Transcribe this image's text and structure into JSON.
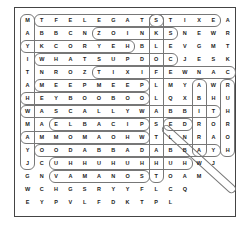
{
  "puzzle": {
    "type": "word-search",
    "columns": 15,
    "rows": [
      "MTFELEGATSTIXEA",
      "ABBCNZOINKSNEWR",
      "YKCORYEHBLEVGMT",
      "IWHATSUPDOCJESK",
      "TNROZTIXIFEWNAC",
      "AMEEPMEEPLMYAWR",
      "HEYBOOBOOLQXBHU",
      "WASCALLYWABBITH",
      "MAELBACIPSEDROR",
      "AMMOMAOHWTLNRAO",
      "YOODABBADABBAYH",
      "JCUHHUHUHHUHWJ",
      "GNVAMANOSTOAM",
      "WCHGSRYYFLCQ",
      "EYPVLFDKTPL"
    ],
    "found_words": [
      {
        "word": "MAYITAHWMAYJ",
        "dir": "vertical",
        "row": 0,
        "col": 0,
        "len": 12
      },
      {
        "word": "TFELEGATS",
        "dir": "horizontal",
        "row": 0,
        "col": 1,
        "len": 9
      },
      {
        "word": "STIXE",
        "dir": "horizontal",
        "row": 0,
        "col": 9,
        "len": 5
      },
      {
        "word": "ZOINKS",
        "dir": "horizontal",
        "row": 1,
        "col": 5,
        "len": 6
      },
      {
        "word": "YKCORYEH",
        "dir": "horizontal",
        "row": 2,
        "col": 0,
        "len": 8
      },
      {
        "word": "WHATSUPDOC",
        "dir": "horizontal",
        "row": 3,
        "col": 1,
        "len": 10
      },
      {
        "word": "TIXIFEWNAC",
        "dir": "horizontal",
        "row": 4,
        "col": 5,
        "len": 10
      },
      {
        "word": "MEEPMEEP",
        "dir": "horizontal",
        "row": 5,
        "col": 1,
        "len": 8
      },
      {
        "word": "HEYBOOBOO",
        "dir": "horizontal",
        "row": 6,
        "col": 0,
        "len": 9
      },
      {
        "word": "WASCALLYWABBIT",
        "dir": "horizontal",
        "row": 7,
        "col": 0,
        "len": 14
      },
      {
        "word": "ELBACIP",
        "dir": "horizontal",
        "row": 8,
        "col": 2,
        "len": 7
      },
      {
        "word": "AMMOMAOHW",
        "dir": "horizontal",
        "row": 9,
        "col": 0,
        "len": 9
      },
      {
        "word": "OODABBADABBAY",
        "dir": "horizontal",
        "row": 10,
        "col": 1,
        "len": 13
      },
      {
        "word": "UHHUHUHHUH",
        "dir": "horizontal",
        "row": 11,
        "col": 2,
        "len": 10
      },
      {
        "word": "VAMANOS",
        "dir": "horizontal",
        "row": 12,
        "col": 2,
        "len": 7
      },
      {
        "word": "SKLOFLABSTABHT",
        "dir": "vertical",
        "row": 0,
        "col": 9,
        "len": 13
      },
      {
        "word": "ABIRAY",
        "dir": "vertical",
        "row": 5,
        "col": 12,
        "len": 6
      },
      {
        "word": "RUHROH",
        "dir": "vertical",
        "row": 5,
        "col": 14,
        "len": 6
      },
      {
        "word": "ED",
        "dir": "horizontal",
        "row": 8,
        "col": 10,
        "len": 2
      },
      {
        "word": "ENRAJ",
        "dir": "diagonal",
        "row": 8,
        "col": 10,
        "len": 5
      }
    ]
  }
}
